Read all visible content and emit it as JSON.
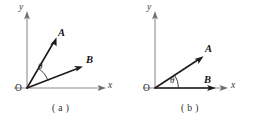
{
  "figure": {
    "background_color": "#ffffff",
    "ink_color": "#1c1c1c",
    "axis_color": "#8c8c8c",
    "panels": [
      {
        "caption": "( a )",
        "origin_label": "O",
        "x_axis_label": "x",
        "y_axis_label": "y",
        "angle_label": "θ",
        "vectors": [
          {
            "label": "A",
            "angle_deg": 60,
            "length": 56
          },
          {
            "label": "B",
            "angle_deg": 21,
            "length": 57
          }
        ]
      },
      {
        "caption": "( b )",
        "origin_label": "O",
        "x_axis_label": "x",
        "y_axis_label": "y",
        "angle_label": "θ",
        "vectors": [
          {
            "label": "A",
            "angle_deg": 34,
            "length": 54
          },
          {
            "label": "B",
            "angle_deg": 0,
            "length": 60
          }
        ]
      }
    ]
  }
}
